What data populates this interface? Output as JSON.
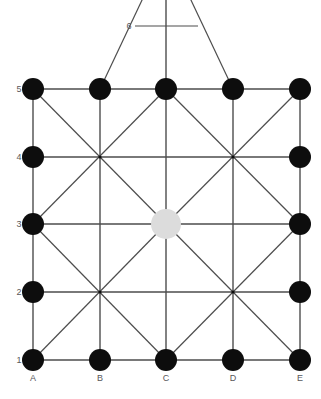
{
  "diagram": {
    "background_color": "#ffffff",
    "node_color": "#0d0d0d",
    "highlight_color": "#dcdcdc",
    "line_color": "#4d4d4d",
    "label_color": "#58585a",
    "node_radius": 11,
    "highlight_radius": 15,
    "column_labels": [
      "A",
      "B",
      "C",
      "D",
      "E"
    ],
    "row_labels": [
      "1",
      "2",
      "3",
      "4",
      "5"
    ],
    "extra_row_label": "6",
    "columns": [
      {
        "label": "A",
        "x": 33
      },
      {
        "label": "B",
        "x": 100
      },
      {
        "label": "C",
        "x": 166
      },
      {
        "label": "D",
        "x": 233
      },
      {
        "label": "E",
        "x": 300
      }
    ],
    "rows": [
      {
        "label": "1",
        "y": 360
      },
      {
        "label": "2",
        "y": 292
      },
      {
        "label": "3",
        "y": 224
      },
      {
        "label": "4",
        "y": 157
      },
      {
        "label": "5",
        "y": 89
      }
    ],
    "nodes": [
      {
        "id": "A1",
        "col": "A",
        "row": "1",
        "x": 33,
        "y": 360,
        "state": "filled"
      },
      {
        "id": "B1",
        "col": "B",
        "row": "1",
        "x": 100,
        "y": 360,
        "state": "filled"
      },
      {
        "id": "C1",
        "col": "C",
        "row": "1",
        "x": 166,
        "y": 360,
        "state": "filled"
      },
      {
        "id": "D1",
        "col": "D",
        "row": "1",
        "x": 233,
        "y": 360,
        "state": "filled"
      },
      {
        "id": "E1",
        "col": "E",
        "row": "1",
        "x": 300,
        "y": 360,
        "state": "filled"
      },
      {
        "id": "A2",
        "col": "A",
        "row": "2",
        "x": 33,
        "y": 292,
        "state": "filled"
      },
      {
        "id": "E2",
        "col": "E",
        "row": "2",
        "x": 300,
        "y": 292,
        "state": "filled"
      },
      {
        "id": "A3",
        "col": "A",
        "row": "3",
        "x": 33,
        "y": 224,
        "state": "filled"
      },
      {
        "id": "C3",
        "col": "C",
        "row": "3",
        "x": 166,
        "y": 224,
        "state": "highlighted"
      },
      {
        "id": "E3",
        "col": "E",
        "row": "3",
        "x": 300,
        "y": 224,
        "state": "filled"
      },
      {
        "id": "A4",
        "col": "A",
        "row": "4",
        "x": 33,
        "y": 157,
        "state": "filled"
      },
      {
        "id": "E4",
        "col": "E",
        "row": "4",
        "x": 300,
        "y": 157,
        "state": "filled"
      },
      {
        "id": "A5",
        "col": "A",
        "row": "5",
        "x": 33,
        "y": 89,
        "state": "filled"
      },
      {
        "id": "B5",
        "col": "B",
        "row": "5",
        "x": 100,
        "y": 89,
        "state": "filled"
      },
      {
        "id": "C5",
        "col": "C",
        "row": "5",
        "x": 166,
        "y": 89,
        "state": "filled"
      },
      {
        "id": "D5",
        "col": "D",
        "row": "5",
        "x": 233,
        "y": 89,
        "state": "filled"
      },
      {
        "id": "E5",
        "col": "E",
        "row": "5",
        "x": 300,
        "y": 89,
        "state": "filled"
      }
    ],
    "junctions": [
      {
        "id": "B4",
        "x": 100,
        "y": 157
      },
      {
        "id": "D4",
        "x": 233,
        "y": 157
      },
      {
        "id": "B2",
        "x": 100,
        "y": 292
      },
      {
        "id": "D2",
        "x": 233,
        "y": 292
      }
    ],
    "edges_horizontal": [
      {
        "from": "A5",
        "to": "E5",
        "x1": 33,
        "y1": 89,
        "x2": 300,
        "y2": 89
      },
      {
        "from": "A4",
        "to": "E4",
        "x1": 33,
        "y1": 157,
        "x2": 300,
        "y2": 157
      },
      {
        "from": "A3",
        "to": "E3",
        "x1": 33,
        "y1": 224,
        "x2": 300,
        "y2": 224
      },
      {
        "from": "A2",
        "to": "E2",
        "x1": 33,
        "y1": 292,
        "x2": 300,
        "y2": 292
      },
      {
        "from": "A1",
        "to": "E1",
        "x1": 33,
        "y1": 360,
        "x2": 300,
        "y2": 360
      },
      {
        "from": "row6-left",
        "to": "row6-right",
        "x1": 135,
        "y1": 26,
        "x2": 198,
        "y2": 26
      }
    ],
    "edges_vertical": [
      {
        "from": "A1",
        "to": "A5",
        "x1": 33,
        "y1": 360,
        "x2": 33,
        "y2": 89
      },
      {
        "from": "B1",
        "to": "B5",
        "x1": 100,
        "y1": 360,
        "x2": 100,
        "y2": 89
      },
      {
        "from": "C1",
        "to": "C-top",
        "x1": 166,
        "y1": 360,
        "x2": 166,
        "y2": 0
      },
      {
        "from": "D1",
        "to": "D5",
        "x1": 233,
        "y1": 360,
        "x2": 233,
        "y2": 89
      },
      {
        "from": "E1",
        "to": "E5",
        "x1": 300,
        "y1": 360,
        "x2": 300,
        "y2": 89
      }
    ],
    "edges_diagonal": [
      {
        "from": "A5",
        "to": "C3",
        "x1": 33,
        "y1": 89,
        "x2": 166,
        "y2": 224
      },
      {
        "from": "C3",
        "to": "E1",
        "x1": 166,
        "y1": 224,
        "x2": 300,
        "y2": 360
      },
      {
        "from": "A1",
        "to": "C3",
        "x1": 33,
        "y1": 360,
        "x2": 166,
        "y2": 224
      },
      {
        "from": "C3",
        "to": "E5",
        "x1": 166,
        "y1": 224,
        "x2": 300,
        "y2": 89
      },
      {
        "from": "A3",
        "to": "C5",
        "x1": 33,
        "y1": 224,
        "x2": 166,
        "y2": 89
      },
      {
        "from": "C5",
        "to": "E3",
        "x1": 166,
        "y1": 89,
        "x2": 300,
        "y2": 224
      },
      {
        "from": "A3",
        "to": "C1",
        "x1": 33,
        "y1": 224,
        "x2": 166,
        "y2": 360
      },
      {
        "from": "C1",
        "to": "E3",
        "x1": 166,
        "y1": 360,
        "x2": 300,
        "y2": 224
      },
      {
        "from": "apex-left",
        "to": "B5",
        "x1": 143,
        "y1": 0,
        "x2": 100,
        "y2": 89
      },
      {
        "from": "apex-right",
        "to": "D5",
        "x1": 190,
        "y1": 0,
        "x2": 233,
        "y2": 89
      }
    ]
  }
}
